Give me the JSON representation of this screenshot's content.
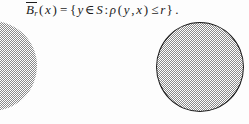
{
  "page": {
    "width": 249,
    "height": 124,
    "background_color": "#fdfdfd",
    "ink_color": "#1c1c1c"
  },
  "formula": {
    "full_text": "B̄r(x) = { y ∈ S : ρ(y, x) ≤ r } .",
    "ball_symbol": "B",
    "radius_subscript": "r",
    "point_arg_open": "(",
    "point_arg": "x",
    "point_arg_close": ")",
    "equals": "=",
    "set_open": "{",
    "element": "y",
    "member_of": "∈",
    "space": "S",
    "colon": ":",
    "metric": "ρ",
    "metric_open": "(",
    "metric_arg1": "y",
    "metric_comma": ",",
    "metric_arg2": "x",
    "metric_close": ")",
    "relation": "≤",
    "radius": "r",
    "set_close": "}",
    "period": "."
  },
  "figures": {
    "left_disk": {
      "label": "clipped-shaded-disk",
      "fill_color": "#8a8a8a",
      "fill_pattern": "checkerboard-dither",
      "outlined": false,
      "clipped_by_page_edge": true,
      "diameter_px": 90
    },
    "right_disk": {
      "label": "outlined-shaded-disk",
      "fill_color": "#8a8a8a",
      "fill_pattern": "checkerboard-dither",
      "outlined": true,
      "outline_color": "#1a1a1a",
      "clipped_by_page_edge": false,
      "diameter_px": 89
    }
  }
}
